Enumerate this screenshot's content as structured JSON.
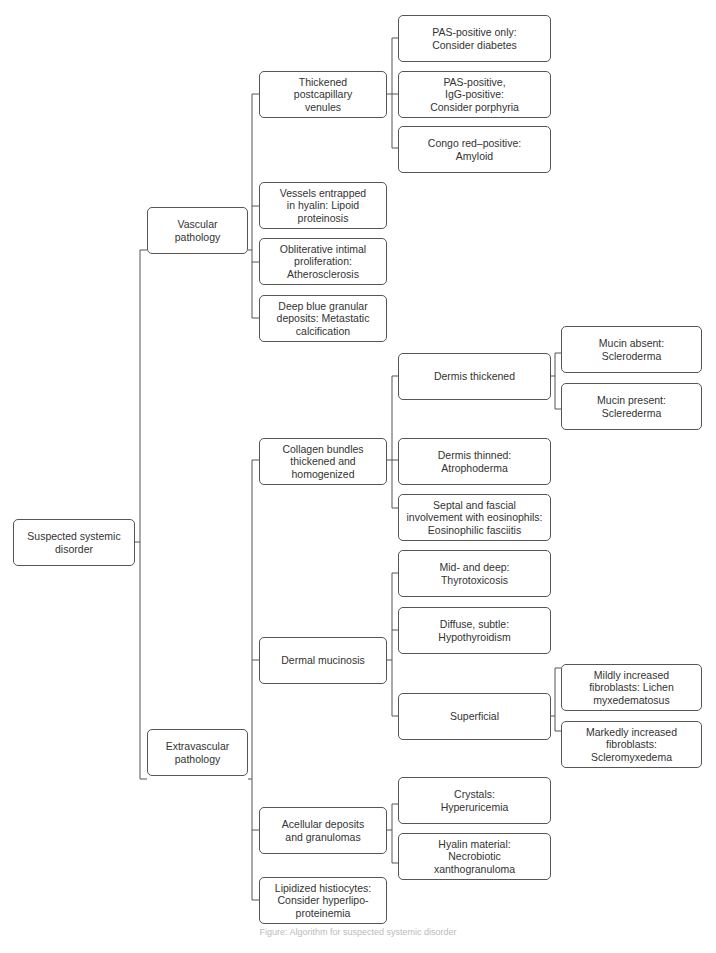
{
  "nodes": {
    "root": "Suspected systemic\ndisorder",
    "vascular": "Vascular\npathology",
    "extravascular": "Extravascular\npathology",
    "thickened_venules": "Thickened\npostcapillary\nvenules",
    "pas_only": "PAS-positive only:\nConsider diabetes",
    "pas_igg": "PAS-positive,\nIgG-positive:\nConsider porphyria",
    "congo": "Congo red–positive:\nAmyloid",
    "hyalin_vessels": "Vessels entrapped\nin hyalin: Lipoid\nproteinosis",
    "obliterative": "Obliterative intimal\nproliferation:\nAtherosclerosis",
    "deep_blue": "Deep blue granular\ndeposits: Metastatic\ncalcification",
    "collagen": "Collagen bundles\nthickened and\nhomogenized",
    "dermis_thickened": "Dermis thickened",
    "mucin_absent": "Mucin absent:\nScleroderma",
    "mucin_present": "Mucin present:\nSclerederma",
    "dermis_thinned": "Dermis thinned:\nAtrophoderma",
    "septal": "Septal and fascial\ninvolvement with eosinophils:\nEosinophilic fasciitis",
    "mucinosis": "Dermal mucinosis",
    "mid_deep": "Mid- and deep:\nThyrotoxicosis",
    "diffuse": "Diffuse, subtle:\nHypothyroidism",
    "superficial": "Superficial",
    "mildly": "Mildly increased\nfibroblasts: Lichen\nmyxedematosus",
    "markedly": "Markedly increased\nfibroblasts:\nScleromyxedema",
    "acellular": "Acellular deposits\nand granulomas",
    "crystals": "Crystals:\nHyperuricemia",
    "hyalin_material": "Hyalin material:\nNecrobiotic\nxanthogranuloma",
    "lipidized": "Lipidized histiocytes:\nConsider hyperlipo-\nproteinemia"
  },
  "caption": "Figure: Algorithm for suspected systemic disorder"
}
